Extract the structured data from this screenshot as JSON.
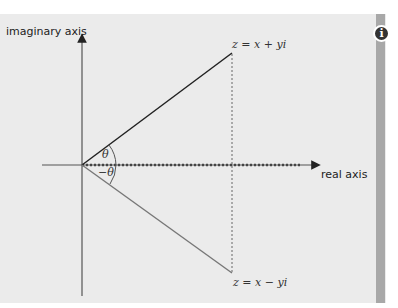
{
  "diagram": {
    "axes": {
      "imaginary_label": "imaginary axis",
      "real_label": "real axis"
    },
    "points": {
      "upper": "z = x + yi",
      "lower": "z = x − yi"
    },
    "angles": {
      "upper": "θ",
      "lower": "−θ"
    },
    "info_icon": "i",
    "colors": {
      "panel": "#ebebeb",
      "side_bar": "#a8a8a8",
      "upper_line": "#222222",
      "lower_line": "#777777",
      "axis": "#555555"
    }
  }
}
